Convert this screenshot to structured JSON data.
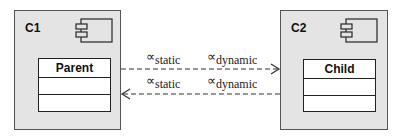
{
  "diagram": {
    "components": [
      {
        "name": "C1",
        "class": {
          "name": "Parent"
        }
      },
      {
        "name": "C2",
        "class": {
          "name": "Child"
        }
      }
    ],
    "links": [
      {
        "direction": "C1-to-C2",
        "style": "dashed",
        "labels": [
          {
            "symbol": "∝",
            "subscript": "static"
          },
          {
            "symbol": "∝",
            "subscript": "dynamic"
          }
        ]
      },
      {
        "direction": "C2-to-C1",
        "style": "dashed",
        "labels": [
          {
            "symbol": "∝",
            "subscript": "static"
          },
          {
            "symbol": "∝",
            "subscript": "dynamic"
          }
        ]
      }
    ],
    "colors": {
      "component_fill": "#e4e4e4",
      "stroke": "#222222"
    }
  }
}
